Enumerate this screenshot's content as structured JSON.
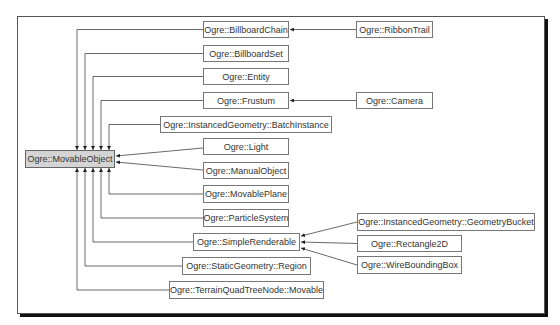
{
  "diagram": {
    "type": "class-inheritance",
    "root": {
      "id": "movableobject",
      "label": "Ogre::MovableObject",
      "fill": "#d4d4d4"
    },
    "nodes": [
      {
        "id": "movableobject",
        "label": "Ogre::MovableObject",
        "x": 25,
        "y": 150,
        "w": 90,
        "h": 18
      },
      {
        "id": "billboardchain",
        "label": "Ogre::BillboardChain",
        "x": 203,
        "y": 21,
        "w": 86,
        "h": 17
      },
      {
        "id": "billboardset",
        "label": "Ogre::BillboardSet",
        "x": 203,
        "y": 45,
        "w": 86,
        "h": 17
      },
      {
        "id": "entity",
        "label": "Ogre::Entity",
        "x": 203,
        "y": 68,
        "w": 86,
        "h": 17
      },
      {
        "id": "frustum",
        "label": "Ogre::Frustum",
        "x": 203,
        "y": 92,
        "w": 86,
        "h": 17
      },
      {
        "id": "batchinstance",
        "label": "Ogre::InstancedGeometry::BatchInstance",
        "x": 160,
        "y": 116,
        "w": 172,
        "h": 17
      },
      {
        "id": "light",
        "label": "Ogre::Light",
        "x": 203,
        "y": 138,
        "w": 86,
        "h": 17
      },
      {
        "id": "manualobject",
        "label": "Ogre::ManualObject",
        "x": 203,
        "y": 162,
        "w": 86,
        "h": 17
      },
      {
        "id": "movableplane",
        "label": "Ogre::MovablePlane",
        "x": 203,
        "y": 185,
        "w": 86,
        "h": 18
      },
      {
        "id": "particlesystem",
        "label": "Ogre::ParticleSystem",
        "x": 203,
        "y": 209,
        "w": 86,
        "h": 18
      },
      {
        "id": "simplerenderable",
        "label": "Ogre::SimpleRenderable",
        "x": 193,
        "y": 233,
        "w": 107,
        "h": 18
      },
      {
        "id": "staticregion",
        "label": "Ogre::StaticGeometry::Region",
        "x": 182,
        "y": 257,
        "w": 129,
        "h": 18
      },
      {
        "id": "terrainmovable",
        "label": "Ogre::TerrainQuadTreeNode::Movable",
        "x": 169,
        "y": 281,
        "w": 155,
        "h": 18
      },
      {
        "id": "ribbontrail",
        "label": "Ogre::RibbonTrail",
        "x": 356,
        "y": 21,
        "w": 77,
        "h": 17
      },
      {
        "id": "camera",
        "label": "Ogre::Camera",
        "x": 356,
        "y": 92,
        "w": 77,
        "h": 17
      },
      {
        "id": "geometrybucket",
        "label": "Ogre::InstancedGeometry::GeometryBucket",
        "x": 357,
        "y": 213,
        "w": 178,
        "h": 18
      },
      {
        "id": "rectangle2d",
        "label": "Ogre::Rectangle2D",
        "x": 357,
        "y": 235,
        "w": 105,
        "h": 17
      },
      {
        "id": "wireboundingbox",
        "label": "Ogre::WireBoundingBox",
        "x": 357,
        "y": 256,
        "w": 105,
        "h": 18
      }
    ],
    "edges": [
      {
        "from": "billboardchain",
        "to": "movableobject"
      },
      {
        "from": "billboardset",
        "to": "movableobject"
      },
      {
        "from": "entity",
        "to": "movableobject"
      },
      {
        "from": "frustum",
        "to": "movableobject"
      },
      {
        "from": "batchinstance",
        "to": "movableobject"
      },
      {
        "from": "light",
        "to": "movableobject"
      },
      {
        "from": "manualobject",
        "to": "movableobject"
      },
      {
        "from": "movableplane",
        "to": "movableobject"
      },
      {
        "from": "particlesystem",
        "to": "movableobject"
      },
      {
        "from": "simplerenderable",
        "to": "movableobject"
      },
      {
        "from": "staticregion",
        "to": "movableobject"
      },
      {
        "from": "terrainmovable",
        "to": "movableobject"
      },
      {
        "from": "ribbontrail",
        "to": "billboardchain"
      },
      {
        "from": "camera",
        "to": "frustum"
      },
      {
        "from": "geometrybucket",
        "to": "simplerenderable"
      },
      {
        "from": "rectangle2d",
        "to": "simplerenderable"
      },
      {
        "from": "wireboundingbox",
        "to": "simplerenderable"
      }
    ]
  }
}
